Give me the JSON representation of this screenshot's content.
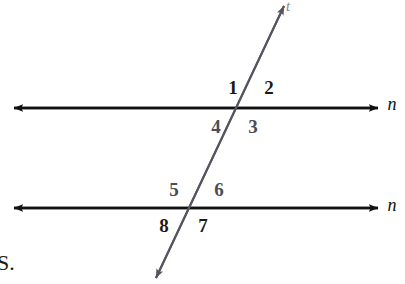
{
  "figure": {
    "background_color": "#ffffff",
    "width": 405,
    "height": 284
  },
  "colors": {
    "parallel_line": "#111111",
    "transversal_line": "#555560",
    "label_dark": "#1a1a1a",
    "label_muted": "#4d4d55",
    "stray_text": "#1a1a1a"
  },
  "lines": [
    {
      "name": "top-parallel-line",
      "label": "n",
      "label_style": "italic",
      "y": 108,
      "x_start": 14,
      "x_end": 378,
      "arrows": "both",
      "label_x": 392,
      "label_y": 104
    },
    {
      "name": "bottom-parallel-line",
      "label": "n",
      "label_style": "italic",
      "y": 208,
      "x_start": 14,
      "x_end": 378,
      "arrows": "both",
      "label_x": 392,
      "label_y": 205
    },
    {
      "name": "transversal-line",
      "label": "t",
      "label_style": "italic",
      "x_top": 284,
      "y_top": 6,
      "x_bottom": 156,
      "y_bottom": 278,
      "arrows": "both",
      "label_x": 288,
      "label_y": 6
    }
  ],
  "intersections": [
    {
      "name": "upper-intersection",
      "x": 241,
      "y": 108
    },
    {
      "name": "lower-intersection",
      "x": 190,
      "y": 208
    }
  ],
  "angles": [
    {
      "id": "1",
      "label": "1",
      "x": 233,
      "y": 87,
      "tone": "dark",
      "position": "upper-left-above"
    },
    {
      "id": "2",
      "label": "2",
      "x": 269,
      "y": 87,
      "tone": "dark",
      "position": "upper-right-above"
    },
    {
      "id": "3",
      "label": "3",
      "x": 253,
      "y": 126,
      "tone": "muted",
      "position": "upper-right-below"
    },
    {
      "id": "4",
      "label": "4",
      "x": 216,
      "y": 126,
      "tone": "muted",
      "position": "upper-left-below"
    },
    {
      "id": "5",
      "label": "5",
      "x": 174,
      "y": 189,
      "tone": "muted",
      "position": "lower-left-above"
    },
    {
      "id": "6",
      "label": "6",
      "x": 219,
      "y": 189,
      "tone": "muted",
      "position": "lower-right-above"
    },
    {
      "id": "7",
      "label": "7",
      "x": 203,
      "y": 225,
      "tone": "dark",
      "position": "lower-right-below"
    },
    {
      "id": "8",
      "label": "8",
      "x": 164,
      "y": 225,
      "tone": "dark",
      "position": "lower-left-below"
    }
  ],
  "stray": {
    "text": "S.",
    "x": -3,
    "y": 252
  }
}
